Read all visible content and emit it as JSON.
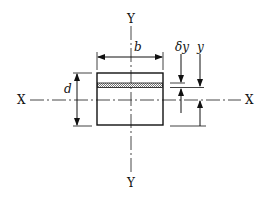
{
  "diagram": {
    "axes": {
      "x_left_label": "X",
      "x_right_label": "X",
      "y_top_label": "Y",
      "y_bottom_label": "Y"
    },
    "dimensions": {
      "width_label": "b",
      "depth_label": "d",
      "strip_thickness_label": "δy",
      "strip_distance_label": "y"
    },
    "colors": {
      "stroke": "#111111",
      "axis": "#333333",
      "hatch": "#999999",
      "background": "#ffffff"
    }
  }
}
